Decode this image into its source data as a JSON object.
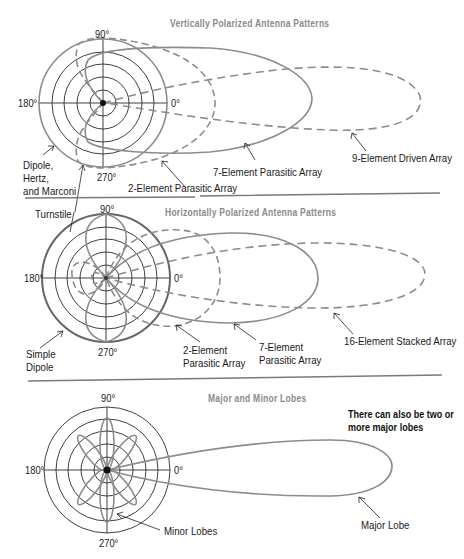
{
  "panels": [
    {
      "title": "Vertically Polarized Antenna Patterns",
      "angles": {
        "top": "90°",
        "left": "180°",
        "right": "0°",
        "bottom": "270°"
      },
      "labels": [
        {
          "text": "Dipole,\nHertz,\nand Marconi"
        },
        {
          "text": "2-Element Parasitic Array"
        },
        {
          "text": "7-Element Parasitic Array"
        },
        {
          "text": "9-Element Driven Array"
        }
      ]
    },
    {
      "title": "Horizontally Polarized Antenna Patterns",
      "angles": {
        "top": "90°",
        "left": "180°",
        "right": "0°",
        "bottom": "270°"
      },
      "labels": [
        {
          "text": "Turnstile"
        },
        {
          "text": "Simple\nDipole"
        },
        {
          "text": "2-Element\nParasitic Array"
        },
        {
          "text": "7-Element\nParasitic Array"
        },
        {
          "text": "16-Element Stacked Array"
        }
      ]
    },
    {
      "title": "Major and Minor Lobes",
      "angles": {
        "top": "90°",
        "left": "180°",
        "right": "0°",
        "bottom": "270°"
      },
      "labels": [
        {
          "text": "Minor Lobes"
        },
        {
          "text": "Major Lobe"
        }
      ],
      "note": "There can also be two or\nmore major lobes"
    }
  ],
  "colors": {
    "grid": "#2a2a2a",
    "pattern": "#8c8c8c",
    "title": "#8a8a8a",
    "text": "#1a1a1a",
    "divider": "#7a7a7a"
  }
}
